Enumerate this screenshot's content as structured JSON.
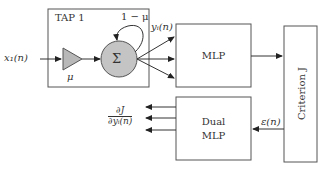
{
  "diagram": {
    "tap_box": {
      "label": "TAP 1"
    },
    "input": {
      "label": "x₁(n)"
    },
    "gain": {
      "label": "μ"
    },
    "summer": {
      "symbol": "Σ",
      "feedback_label": "1 − μ"
    },
    "tap_output": {
      "label": "yᵢ(n)"
    },
    "mlp": {
      "label": "MLP"
    },
    "dual_mlp": {
      "line1": "Dual",
      "line2": "MLP"
    },
    "criterion": {
      "label": "Criterion J"
    },
    "error": {
      "label": "ε(n)"
    },
    "gradient": {
      "numerator": "∂J",
      "denominator": "∂yᵢ(n)"
    },
    "colors": {
      "stroke": "#555555",
      "fill_gray": "#b8b8b8",
      "text": "#333333"
    }
  }
}
